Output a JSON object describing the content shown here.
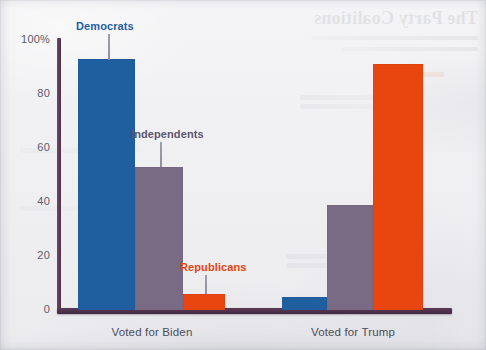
{
  "page": {
    "showthrough_title": "The Party Coalitions",
    "showthrough_note": "reverse-side text bleeding through scanned page"
  },
  "chart_data": {
    "type": "bar",
    "title": "",
    "xlabel": "",
    "ylabel": "",
    "ylim": [
      0,
      100
    ],
    "yticks": [
      0,
      20,
      40,
      60,
      80,
      100
    ],
    "ytick_labels": [
      "0",
      "20",
      "40",
      "60",
      "80",
      "100%"
    ],
    "grid": false,
    "legend_position": "inline-annotations",
    "categories": [
      "Voted for Biden",
      "Voted for Trump"
    ],
    "series": [
      {
        "name": "Democrats",
        "color": "#1f5fa0",
        "values": [
          93,
          5
        ]
      },
      {
        "name": "Independents",
        "color": "#7a6b84",
        "values": [
          53,
          39
        ]
      },
      {
        "name": "Republicans",
        "color": "#e8450f",
        "values": [
          6,
          91
        ]
      }
    ],
    "annotations": [
      {
        "text": "Democrats",
        "series": "Democrats",
        "group": "Voted for Biden",
        "color": "#1f5fa0"
      },
      {
        "text": "Independents",
        "series": "Independents",
        "group": "Voted for Biden",
        "color": "#5d5470"
      },
      {
        "text": "Republicans",
        "series": "Republicans",
        "group": "Voted for Biden",
        "color": "#e8450f"
      }
    ],
    "axis_color": "#4e2f4a",
    "background_color": "#f1f1f3"
  }
}
